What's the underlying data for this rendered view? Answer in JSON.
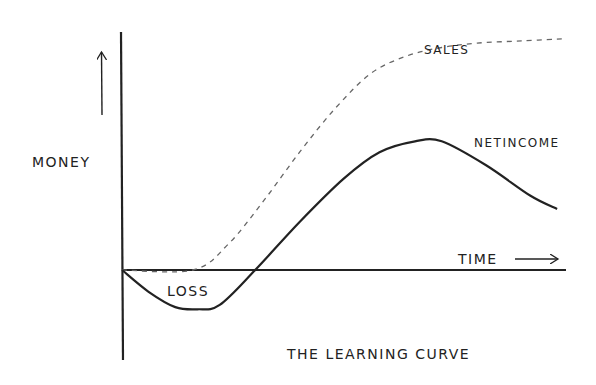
{
  "chart_data": {
    "type": "line",
    "title": "THE LEARNING CURVE",
    "xlabel": "TIME",
    "ylabel": "MONEY",
    "xlim": [
      0,
      100
    ],
    "ylim": [
      -10,
      55
    ],
    "grid": false,
    "legend": "none (inline labels)",
    "series": [
      {
        "name": "SALES",
        "style": "dashed",
        "x": [
          0,
          16,
          24,
          32,
          40,
          48,
          56,
          64,
          72,
          80,
          90,
          100
        ],
        "y": [
          0,
          0,
          6,
          16,
          27,
          37,
          45,
          49,
          51,
          52,
          52.5,
          53
        ]
      },
      {
        "name": "NET INCOME",
        "style": "solid",
        "x": [
          0,
          6,
          12,
          17,
          22,
          30,
          40,
          50,
          58,
          66,
          72,
          82,
          92,
          98
        ],
        "y": [
          0,
          -5,
          -8.5,
          -9,
          -8,
          0,
          11,
          21,
          27,
          29.5,
          29.5,
          24,
          17,
          14
        ]
      }
    ],
    "annotations": [
      {
        "text": "LOSS",
        "region": "below x-axis, between origin and net income zero-crossing"
      },
      {
        "text": "SALES",
        "anchor": "under the dashed curve near its plateau"
      },
      {
        "text": "NETINCOME",
        "anchor": "right of the net income peak"
      },
      {
        "text": "TIME",
        "anchor": "above x-axis near right end, with right arrow"
      }
    ],
    "colors": {
      "ink": "#222222",
      "dashed": "#666666",
      "background": "#ffffff"
    }
  }
}
